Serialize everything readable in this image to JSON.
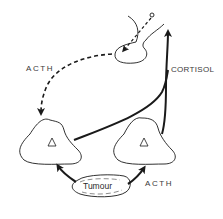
{
  "diagram": {
    "type": "hormone feedback loop (ectopic ACTH)",
    "colors": {
      "ink": "#1a1a1a",
      "text": "#3a3a3a",
      "background": "#ffffff"
    },
    "nodes": [
      {
        "id": "pituitary",
        "shape": "pituitary gland with stalk"
      },
      {
        "id": "adrenal-left",
        "shape": "rounded triangle with inner triangle"
      },
      {
        "id": "adrenal-right",
        "shape": "rounded triangle with inner triangle"
      },
      {
        "id": "tumour",
        "shape": "irregular oval",
        "label": "Tumour"
      }
    ],
    "labels": {
      "acth_top": "ACTH",
      "cortisol": "CORTISOL",
      "tumour": "Tumour",
      "acth_bottom": "ACTH"
    },
    "edges": [
      {
        "from": "pituitary",
        "to": "adrenal-left",
        "label": "ACTH",
        "style": "dashed"
      },
      {
        "from": "adrenal-left",
        "to": "pituitary",
        "label": "CORTISOL",
        "style": "solid"
      },
      {
        "from": "adrenal-right",
        "to": "pituitary",
        "label": "CORTISOL",
        "style": "solid"
      },
      {
        "from": "tumour",
        "to": "adrenal-left",
        "label": "",
        "style": "solid"
      },
      {
        "from": "tumour",
        "to": "adrenal-right",
        "label": "ACTH",
        "style": "solid"
      },
      {
        "from": "hypothalamus",
        "to": "pituitary",
        "label": "",
        "style": "dashed"
      }
    ]
  }
}
